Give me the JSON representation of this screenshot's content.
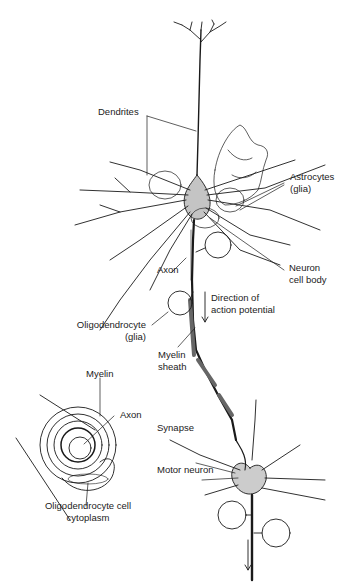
{
  "figure": {
    "labels": {
      "dendrites": "Dendrites",
      "astrocytes_line1": "Astrocytes",
      "astrocytes_line2": "(glia)",
      "axon_top": "Axon",
      "neuron_body_line1": "Neuron",
      "neuron_body_line2": "cell body",
      "direction_line1": "Direction of",
      "direction_line2": "action potential",
      "oligo_line1": "Oligodendrocyte",
      "oligo_line2": "(glia)",
      "myelin_sheath_line1": "Myelin",
      "myelin_sheath_line2": "sheath",
      "myelin": "Myelin",
      "axon_inset": "Axon",
      "cytoplasm_line1": "Oligodendrocyte cell",
      "cytoplasm_line2": "cytoplasm",
      "synapse": "Synapse",
      "motor_neuron": "Motor neuron"
    },
    "colors": {
      "ink": "#1a1a1a",
      "shade": "#8a8a8a",
      "paper": "#ffffff"
    }
  }
}
